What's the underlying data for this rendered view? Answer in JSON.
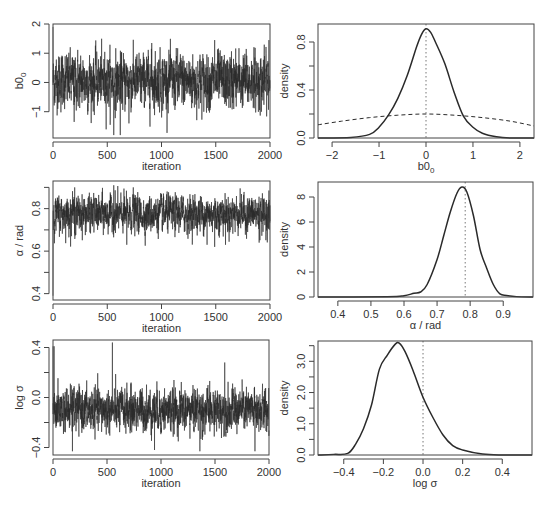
{
  "figure": {
    "rows": 3,
    "cols": 2,
    "line_color": "#2a2a2a",
    "frame_color": "#444444"
  },
  "chart_data": [
    {
      "id": "trace-b0",
      "type": "line",
      "title": "",
      "xlabel": "iteration",
      "ylabel": "b0",
      "ylabel_sub": "0",
      "xlim": [
        0,
        2000
      ],
      "ylim": [
        -1.9,
        2.0
      ],
      "xticks": [
        0,
        500,
        1000,
        1500,
        2000
      ],
      "yticks": [
        -1,
        0,
        1,
        2
      ],
      "ytick_labels": [
        "-1",
        "0",
        "1",
        "2"
      ],
      "frame": {
        "x": 53,
        "y": 24,
        "w": 217,
        "h": 114
      },
      "trace": {
        "start": 1.9,
        "mean": 0.05,
        "spread": 0.55,
        "n": 2000,
        "spikes": [
          [
            560,
            -1.8
          ],
          [
            620,
            -1.8
          ],
          [
            700,
            -1.4
          ],
          [
            195,
            -1.35
          ],
          [
            910,
            1.35
          ],
          [
            1490,
            1.45
          ],
          [
            1990,
            1.45
          ]
        ]
      },
      "grid": false
    },
    {
      "id": "density-b0",
      "type": "line",
      "title": "",
      "xlabel": "b0",
      "xlabel_sub": "0",
      "ylabel": "density",
      "xlim": [
        -2.3,
        2.3
      ],
      "ylim": [
        0,
        0.95
      ],
      "xticks": [
        -2,
        -1,
        0,
        1,
        2
      ],
      "xtick_labels": [
        "-2",
        "-1",
        "0",
        "1",
        "2"
      ],
      "yticks": [
        0.0,
        0.4,
        0.8
      ],
      "yminor": [
        0.2,
        0.6
      ],
      "ytick_labels": [
        "0.0",
        "0.4",
        "0.8"
      ],
      "frame": {
        "x": 318,
        "y": 24,
        "w": 216,
        "h": 114
      },
      "series": [
        {
          "name": "posterior",
          "style": "solid",
          "x": [
            -2.3,
            -1.6,
            -1.2,
            -1.0,
            -0.8,
            -0.6,
            -0.4,
            -0.2,
            -0.1,
            0.0,
            0.1,
            0.2,
            0.4,
            0.6,
            0.8,
            1.0,
            1.2,
            1.5,
            1.8,
            2.3
          ],
          "y": [
            0.0,
            0.005,
            0.03,
            0.09,
            0.19,
            0.33,
            0.52,
            0.76,
            0.86,
            0.91,
            0.88,
            0.8,
            0.62,
            0.38,
            0.18,
            0.09,
            0.04,
            0.01,
            0.0,
            0.0
          ]
        },
        {
          "name": "prior",
          "style": "dashed",
          "x": [
            -2.3,
            -1.8,
            -1.2,
            -0.6,
            0.0,
            0.6,
            1.2,
            1.8,
            2.3
          ],
          "y": [
            0.11,
            0.14,
            0.17,
            0.19,
            0.2,
            0.19,
            0.17,
            0.14,
            0.1
          ]
        }
      ],
      "vline": {
        "x": 0.0,
        "style": "dotted"
      },
      "grid": false
    },
    {
      "id": "trace-alpha",
      "type": "line",
      "title": "",
      "xlabel": "iteration",
      "ylabel": "α / rad",
      "xlim": [
        0,
        2000
      ],
      "ylim": [
        0.37,
        0.93
      ],
      "xticks": [
        0,
        500,
        1000,
        1500,
        2000
      ],
      "yticks": [
        0.4,
        0.6,
        0.8
      ],
      "yminor": [
        0.5,
        0.7,
        0.9
      ],
      "ytick_labels": [
        "0.4",
        "0.6",
        "0.8"
      ],
      "frame": {
        "x": 53,
        "y": 181,
        "w": 217,
        "h": 119
      },
      "trace": {
        "start": 0.39,
        "mean": 0.775,
        "spread": 0.05,
        "n": 2000,
        "spikes": [
          [
            560,
            0.91
          ],
          [
            740,
            0.9
          ],
          [
            200,
            0.9
          ],
          [
            1420,
            0.63
          ],
          [
            1490,
            0.62
          ],
          [
            1590,
            0.63
          ],
          [
            1900,
            0.64
          ],
          [
            680,
            0.63
          ]
        ]
      },
      "grid": false
    },
    {
      "id": "density-alpha",
      "type": "line",
      "title": "",
      "xlabel": "α / rad",
      "ylabel": "density",
      "xlim": [
        0.34,
        0.99
      ],
      "ylim": [
        0,
        9.2
      ],
      "xticks": [
        0.4,
        0.5,
        0.6,
        0.7,
        0.8,
        0.9
      ],
      "xtick_labels": [
        "0.4",
        "0.5",
        "0.6",
        "0.7",
        "0.8",
        "0.9"
      ],
      "yticks": [
        0,
        2,
        4,
        6,
        8
      ],
      "ytick_labels": [
        "0",
        "2",
        "4",
        "6",
        "8"
      ],
      "frame": {
        "x": 318,
        "y": 182,
        "w": 215,
        "h": 115
      },
      "series": [
        {
          "name": "posterior",
          "style": "solid",
          "x": [
            0.34,
            0.55,
            0.6,
            0.63,
            0.65,
            0.67,
            0.7,
            0.72,
            0.74,
            0.76,
            0.775,
            0.79,
            0.81,
            0.83,
            0.85,
            0.87,
            0.89,
            0.91,
            0.94,
            0.99
          ],
          "y": [
            0.0,
            0.02,
            0.1,
            0.3,
            0.4,
            1.0,
            3.0,
            4.9,
            6.8,
            8.3,
            8.8,
            8.4,
            6.5,
            3.8,
            2.3,
            1.0,
            0.25,
            0.12,
            0.03,
            0.0
          ]
        }
      ],
      "vline": {
        "x": 0.785,
        "style": "dotted"
      },
      "grid": false
    },
    {
      "id": "trace-logsigma",
      "type": "line",
      "title": "",
      "xlabel": "iteration",
      "ylabel": "log σ",
      "xlim": [
        0,
        2000
      ],
      "ylim": [
        -0.46,
        0.46
      ],
      "xticks": [
        0,
        500,
        1000,
        1500,
        2000
      ],
      "yticks": [
        -0.4,
        0.0,
        0.4
      ],
      "yminor": [
        -0.2,
        0.2
      ],
      "ytick_labels": [
        "-0.4",
        "0.0",
        "0.4"
      ],
      "frame": {
        "x": 53,
        "y": 340,
        "w": 216,
        "h": 115
      },
      "trace": {
        "start": 0.41,
        "mean": -0.1,
        "spread": 0.1,
        "n": 2000,
        "spikes": [
          [
            550,
            0.44
          ],
          [
            10,
            0.41
          ],
          [
            180,
            -0.43
          ],
          [
            940,
            -0.42
          ],
          [
            1360,
            -0.43
          ],
          [
            1870,
            -0.43
          ],
          [
            1590,
            0.28
          ]
        ]
      },
      "grid": false
    },
    {
      "id": "density-logsigma",
      "type": "line",
      "title": "",
      "xlabel": "log σ",
      "ylabel": "density",
      "xlim": [
        -0.53,
        0.55
      ],
      "ylim": [
        0,
        3.65
      ],
      "xticks": [
        -0.4,
        -0.2,
        0.0,
        0.2,
        0.4
      ],
      "xtick_labels": [
        "-0.4",
        "-0.2",
        "0.0",
        "0.2",
        "0.4"
      ],
      "yticks": [
        0.0,
        1.0,
        2.0,
        3.0
      ],
      "yminor": [
        0.5,
        1.5,
        2.5,
        3.5
      ],
      "ytick_labels": [
        "0.0",
        "1.0",
        "2.0",
        "3.0"
      ],
      "frame": {
        "x": 318,
        "y": 341,
        "w": 214,
        "h": 114
      },
      "series": [
        {
          "name": "posterior",
          "style": "solid",
          "x": [
            -0.53,
            -0.45,
            -0.38,
            -0.34,
            -0.3,
            -0.26,
            -0.22,
            -0.18,
            -0.14,
            -0.12,
            -0.09,
            -0.05,
            0.0,
            0.05,
            0.1,
            0.15,
            0.2,
            0.3,
            0.4,
            0.55
          ],
          "y": [
            0.0,
            0.02,
            0.05,
            0.35,
            0.85,
            1.6,
            2.75,
            3.2,
            3.55,
            3.58,
            3.3,
            2.7,
            1.85,
            1.2,
            0.65,
            0.3,
            0.16,
            0.03,
            0.0,
            0.0
          ]
        }
      ],
      "vline": {
        "x": 0.0,
        "style": "dotted"
      },
      "grid": false
    }
  ]
}
